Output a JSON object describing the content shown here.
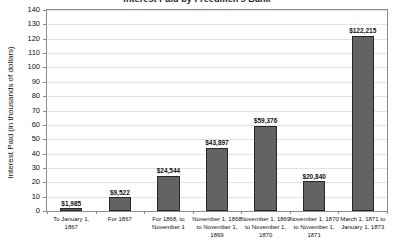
{
  "chart_data": {
    "type": "bar",
    "title": "Interest Paid by Freedmen's Bank",
    "xlabel": "",
    "ylabel": "Interest Paid (in thousands of dollars)",
    "ylim": [
      0,
      140
    ],
    "ytick_step": 10,
    "ytick_labels": [
      "140",
      "130",
      "120",
      "110",
      "100",
      "90",
      "80",
      "70",
      "60",
      "50",
      "40",
      "30",
      "20",
      "10",
      "0"
    ],
    "grid": true,
    "legend": "none",
    "bar_color": "#636363",
    "bar_edge_color": "#262626",
    "grid_color": "#e3e3e3",
    "axis_color": "#8c8c8c",
    "categories": [
      "To January 1, 1867",
      "For 1867",
      "For 1868, to November 1",
      "November 1, 1868 to November 1, 1869",
      "November 1, 1869 to November 1, 1870",
      "November 1, 1870 to November 1, 1871",
      "March 1, 1871 to January 1, 1873"
    ],
    "category_lines": [
      [
        "To January 1,",
        "1867"
      ],
      [
        "For 1867"
      ],
      [
        "For 1868, to",
        "November 1"
      ],
      [
        "November 1, 1868",
        "to November 1,",
        "1869"
      ],
      [
        "November 1, 1869",
        "to November 1,",
        "1870"
      ],
      [
        "November 1, 1870",
        "to November 1,",
        "1871"
      ],
      [
        "March 1, 1871 to",
        "January 1, 1873"
      ]
    ],
    "values": [
      1.985,
      9.522,
      24.544,
      43.897,
      59.376,
      20.84,
      122.215
    ],
    "value_labels": [
      "$1,985",
      "$9,522",
      "$24,544",
      "$43,897",
      "$59,376",
      "$20,840",
      "$122,215"
    ]
  }
}
